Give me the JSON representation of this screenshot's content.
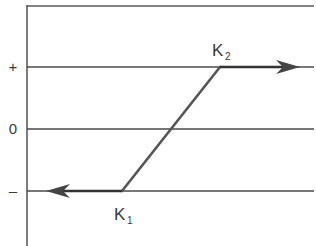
{
  "diagram": {
    "type": "hysteresis-switching-characteristic",
    "levels": [
      {
        "name": "plus",
        "label": "+"
      },
      {
        "name": "zero",
        "label": "0"
      },
      {
        "name": "minus",
        "label": "–"
      }
    ],
    "points": {
      "k1": {
        "letter": "K",
        "subscript": "1",
        "level": "minus"
      },
      "k2": {
        "letter": "K",
        "subscript": "2",
        "level": "plus"
      }
    },
    "arrows": [
      {
        "from": "k2",
        "direction": "right",
        "level": "plus"
      },
      {
        "from": "k1",
        "direction": "left",
        "level": "minus"
      }
    ],
    "colors": {
      "line": "#4a4a4a",
      "arrow": "#333333",
      "text": "#3a3a3a",
      "background": "#ffffff"
    }
  }
}
